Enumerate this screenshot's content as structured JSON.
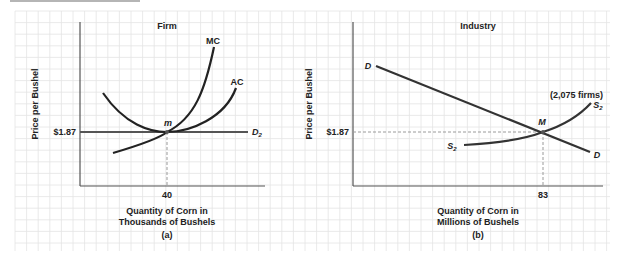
{
  "colors": {
    "grid": "#e4e4e4",
    "axis": "#555555",
    "curve": "#222222",
    "price_line": "#555555",
    "dashed": "#9a9a9a",
    "text": "#222222"
  },
  "chart_data": [
    {
      "type": "line",
      "title": "Firm",
      "panel_label": "(a)",
      "xlabel": "Quantity of Corn in Thousands of Bushels",
      "xlabel_lines": [
        "Quantity of Corn in",
        "Thousands of Bushels"
      ],
      "ylabel": "Price per Bushel",
      "x_ticks": [
        {
          "value": 40,
          "label": "40"
        }
      ],
      "y_ticks": [
        {
          "value": 1.87,
          "label": "$1.87"
        }
      ],
      "equilibrium": {
        "label": "m",
        "x": 40,
        "price": 1.87
      },
      "series": [
        {
          "name": "MC",
          "label": "MC",
          "description": "Marginal cost curve, upward sloping, passes through m"
        },
        {
          "name": "AC",
          "label": "AC",
          "description": "U-shaped average cost curve with minimum at m"
        },
        {
          "name": "D2",
          "label": "D",
          "subscript": "2",
          "description": "Horizontal demand curve at $1.87"
        }
      ],
      "grid": true
    },
    {
      "type": "line",
      "title": "Industry",
      "panel_label": "(b)",
      "xlabel": "Quantity of Corn in Millions of Bushels",
      "xlabel_lines": [
        "Quantity of Corn in",
        "Millions of Bushels"
      ],
      "ylabel": "Price per Bushel",
      "x_ticks": [
        {
          "value": 83,
          "label": "83"
        }
      ],
      "y_ticks": [
        {
          "value": 1.87,
          "label": "$1.87"
        }
      ],
      "equilibrium": {
        "label": "M",
        "x": 83,
        "price": 1.87
      },
      "annotation": "(2,075 firms)",
      "series": [
        {
          "name": "D",
          "label": "D",
          "description": "Downward sloping industry demand curve"
        },
        {
          "name": "S2",
          "label": "S",
          "subscript": "2",
          "description": "Upward sloping industry supply curve with 2,075 firms"
        }
      ],
      "grid": true
    }
  ]
}
